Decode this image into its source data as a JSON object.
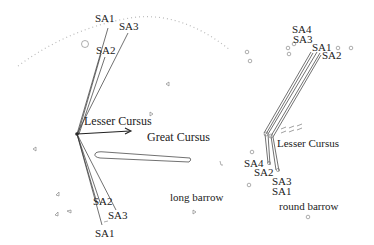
{
  "left_panel": {
    "labels": {
      "sa1_top": "SA1",
      "sa3_top": "SA3",
      "sa2_top": "SA2",
      "lesser_cursus": "Lesser Cursus",
      "great_cursus": "Great Cursus",
      "long_barrow": "long barrow",
      "sa2_bottom": "SA2",
      "sa3_bottom": "SA3",
      "sa1_bottom": "SA1"
    }
  },
  "right_panel": {
    "labels": {
      "sa4_top": "SA4",
      "sa3_top": "SA3",
      "sa1_top": "SA1",
      "sa2_top": "SA2",
      "lesser_cursus": "Lesser Cursus",
      "sa4_bottom": "SA4",
      "sa2_bottom": "SA2",
      "sa3_bottom": "SA3",
      "sa1_bottom": "SA1",
      "round_barrow": "round barrow"
    }
  },
  "colors": {
    "line": "#333333",
    "text": "#222222",
    "horizon": "#bbbbbb"
  }
}
